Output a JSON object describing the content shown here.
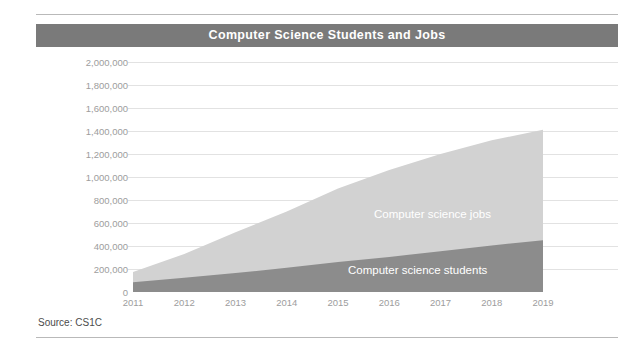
{
  "title": "Computer Science Students and Jobs",
  "source_note": "Source: CS1C",
  "colors": {
    "title_banner": "#7a7a7a",
    "jobs_area": "#d2d2d2",
    "students_area": "#8c8c8c",
    "gridline": "#e2e2e2",
    "tick_text": "#9d9d9d",
    "label_text": "#ffffff",
    "rule": "#b9b9b9"
  },
  "labels": {
    "jobs": "Computer science jobs",
    "students": "Computer science students"
  },
  "chart_data": {
    "type": "area",
    "title": "Computer Science Students and Jobs",
    "subtitle": "",
    "xlabel": "",
    "ylabel": "",
    "stacked": false,
    "grid": true,
    "legend_position": "inline-labels",
    "x": [
      2011,
      2012,
      2013,
      2014,
      2015,
      2016,
      2017,
      2018,
      2019
    ],
    "categories": [
      "2011",
      "2012",
      "2013",
      "2014",
      "2015",
      "2016",
      "2017",
      "2018",
      "2019"
    ],
    "xlim": [
      2011,
      2019
    ],
    "ylim": [
      0,
      2000000
    ],
    "ytick_values": [
      0,
      200000,
      400000,
      600000,
      800000,
      1000000,
      1200000,
      1400000,
      1600000,
      1800000,
      2000000
    ],
    "ytick_labels": [
      "0",
      "200,000",
      "400,000",
      "600,000",
      "800,000",
      "1,000,000",
      "1,200,000",
      "1,400,000",
      "1,600,000",
      "1,800,000",
      "2,000,000"
    ],
    "series": [
      {
        "name": "Computer science jobs",
        "color": "#d2d2d2",
        "values": [
          175000,
          330000,
          520000,
          700000,
          900000,
          1060000,
          1200000,
          1320000,
          1410000
        ]
      },
      {
        "name": "Computer science students",
        "color": "#8c8c8c",
        "values": [
          85000,
          125000,
          165000,
          210000,
          260000,
          305000,
          355000,
          405000,
          450000
        ]
      }
    ],
    "annotations": [
      {
        "text": "Computer science jobs",
        "series": "Computer science jobs"
      },
      {
        "text": "Computer science students",
        "series": "Computer science students"
      }
    ]
  },
  "geometry": {
    "plot_left": 133,
    "plot_right": 543,
    "plot_top": 62,
    "plot_bottom": 292
  }
}
